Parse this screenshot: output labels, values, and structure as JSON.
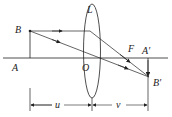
{
  "diagram": {
    "type": "convex-lens-ray-diagram",
    "labels": {
      "lens": "L",
      "object_top": "B",
      "object_base": "A",
      "optical_center": "O",
      "focus": "F",
      "image_base": "A′",
      "image_top": "B′",
      "object_distance": "u",
      "image_distance": "v"
    },
    "colors": {
      "line": "#222222",
      "background": "#ffffff"
    }
  }
}
